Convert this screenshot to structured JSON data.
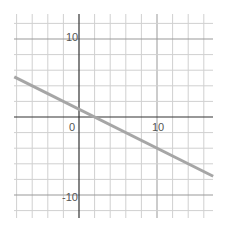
{
  "chart_data": {
    "type": "line",
    "title": "",
    "xlabel": "",
    "ylabel": "",
    "xlim": [
      -8.3,
      17.2
    ],
    "ylim": [
      -12.8,
      13.3
    ],
    "grid": true,
    "grid_step": 2,
    "x_tick_labels": [
      "0",
      "10"
    ],
    "y_tick_labels": [
      "10",
      "-10"
    ],
    "series": [
      {
        "name": "line",
        "color": "#a6a6a6",
        "x": [
          -8.3,
          2,
          10,
          17.2
        ],
        "y": [
          5.15,
          0,
          -4,
          -7.6
        ],
        "equation": "y = -0.5x + 1"
      }
    ]
  },
  "colors": {
    "grid": "#d0d0d0",
    "axis": "#333333",
    "line": "#a6a6a6"
  },
  "labels": {
    "origin": "0",
    "x10": "10",
    "y10": "10",
    "yneg10": "-10"
  }
}
